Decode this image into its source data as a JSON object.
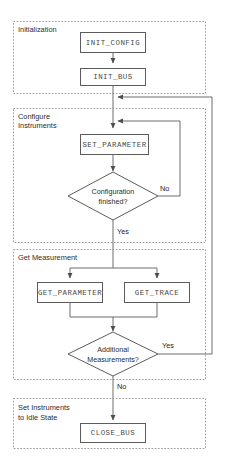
{
  "diagram": {
    "colors": {
      "background": "#ffffff",
      "group_border": "#9a9a9a",
      "node_border": "#5c5c5c",
      "connector": "#6d6d6d",
      "text": "#2b2b2b",
      "mono_text": "#4a4a4a"
    },
    "groups": [
      {
        "id": "initialization",
        "label_line1": "Initialization",
        "label_line2": ""
      },
      {
        "id": "configure-instruments",
        "label_line1": "Configure",
        "label_line2": "Instruments"
      },
      {
        "id": "get-measurement",
        "label_line1": "Get Measurement",
        "label_line2": ""
      },
      {
        "id": "set-idle",
        "label_line1": "Set Instruments",
        "label_line2": "to Idle State"
      }
    ],
    "nodes": [
      {
        "id": "init-config",
        "label": "INIT_CONFIG",
        "type": "process"
      },
      {
        "id": "init-bus",
        "label": "INIT_BUS",
        "type": "process"
      },
      {
        "id": "set-parameter",
        "label": "SET_PARAMETER",
        "type": "process"
      },
      {
        "id": "configuration-finished",
        "label_line1": "Configuration",
        "label_line2": "finished?",
        "type": "decision"
      },
      {
        "id": "get-parameter",
        "label": "GET_PARAMETER",
        "type": "process"
      },
      {
        "id": "get-trace",
        "label": "GET_TRACE",
        "type": "process"
      },
      {
        "id": "additional-measurements",
        "label_line1": "Additional",
        "label_line2": "Measurements?",
        "type": "decision"
      },
      {
        "id": "close-bus",
        "label": "CLOSE_BUS",
        "type": "process"
      }
    ],
    "edge_labels": {
      "config_no": "No",
      "config_yes": "Yes",
      "measure_yes": "Yes",
      "measure_no": "No"
    }
  }
}
